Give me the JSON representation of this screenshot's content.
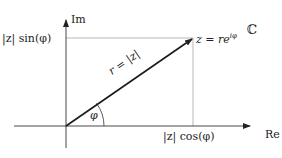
{
  "diagram": {
    "axes": {
      "imag_label": "Im",
      "real_label": "Re"
    },
    "plane_label": "ℂ",
    "point_label": "z = re",
    "point_exponent": "iφ",
    "vector_label": "r = |z|",
    "angle_label": "φ",
    "y_projection_label": "|z| sin(φ)",
    "x_projection_label": "|z| cos(φ)",
    "colors": {
      "axis": "#222222",
      "vector": "#1a1a1a",
      "guide": "#999999"
    }
  }
}
